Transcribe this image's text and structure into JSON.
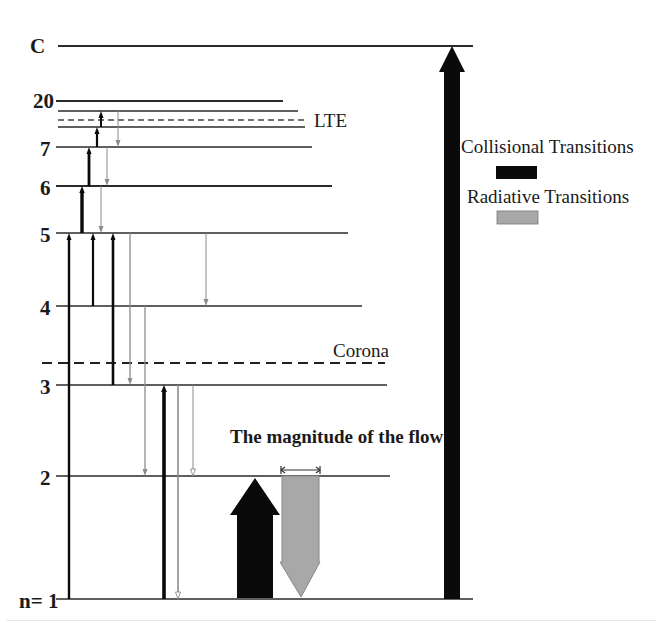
{
  "levels": [
    {
      "id": "C",
      "label": "C",
      "kind": "continuum"
    },
    {
      "id": "20",
      "label": "20",
      "kind": "bound"
    },
    {
      "id": "lte-a",
      "label": "",
      "kind": "bound"
    },
    {
      "id": "lte-b",
      "label": "",
      "kind": "bound"
    },
    {
      "id": "7",
      "label": "7",
      "kind": "bound"
    },
    {
      "id": "6",
      "label": "6",
      "kind": "bound"
    },
    {
      "id": "5",
      "label": "5",
      "kind": "bound"
    },
    {
      "id": "4",
      "label": "4",
      "kind": "bound"
    },
    {
      "id": "3",
      "label": "3",
      "kind": "bound"
    },
    {
      "id": "2",
      "label": "2",
      "kind": "bound"
    },
    {
      "id": "1",
      "label": "n= 1",
      "kind": "ground"
    }
  ],
  "boundaries": {
    "lte": {
      "label": "LTE"
    },
    "corona": {
      "label": "Corona"
    }
  },
  "legend": {
    "collisional": {
      "label": "Collisional Transitions",
      "color": "#0a0a0a"
    },
    "radiative": {
      "label": "Radiative Transitions",
      "color": "#a8a8a8"
    }
  },
  "flow_note": {
    "label": "The magnitude of the flow"
  },
  "transitions": {
    "collisional": [
      {
        "from": "1",
        "to": "5"
      },
      {
        "from": "4",
        "to": "5"
      },
      {
        "from": "3",
        "to": "5"
      },
      {
        "from": "5",
        "to": "6"
      },
      {
        "from": "6",
        "to": "7"
      },
      {
        "from": "7",
        "to": "lte-b"
      },
      {
        "from": "lte-b",
        "to": "lte-a"
      },
      {
        "from": "1",
        "to": "3"
      },
      {
        "from": "1",
        "to": "C"
      }
    ],
    "radiative": [
      {
        "from": "lte-a",
        "to": "7"
      },
      {
        "from": "7",
        "to": "6"
      },
      {
        "from": "6",
        "to": "5"
      },
      {
        "from": "5",
        "to": "4"
      },
      {
        "from": "5",
        "to": "3"
      },
      {
        "from": "4",
        "to": "2"
      },
      {
        "from": "3",
        "to": "2"
      },
      {
        "from": "3",
        "to": "1"
      }
    ]
  },
  "colors": {
    "line": "#2a2a2a",
    "collisional": "#0a0a0a",
    "radiative": "#8c8c8c",
    "radiative_fill": "#a8a8a8"
  }
}
